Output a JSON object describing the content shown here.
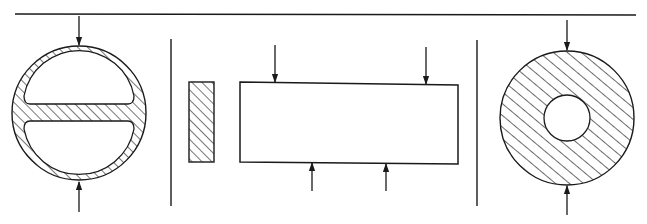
{
  "diagram": {
    "colors": {
      "ink": "#1a1a1a",
      "background": "#ffffff"
    },
    "panels": [
      {
        "id": "left",
        "shape": "hollow circular tube with central horizontal web (two D-shaped cavities)",
        "loads": [
          "top-compression-arrow",
          "bottom-compression-arrow"
        ]
      },
      {
        "id": "middle",
        "shape": "thin hatched rectangular section beside a long beam elevation",
        "loads": [
          "two downward arrows on top",
          "two upward arrows on bottom"
        ]
      },
      {
        "id": "right",
        "shape": "thick-walled hatched ring (annulus)",
        "loads": [
          "top-compression-arrow",
          "bottom-compression-arrow"
        ]
      }
    ]
  }
}
